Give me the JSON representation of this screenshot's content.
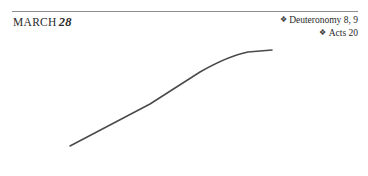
{
  "page": {
    "background_color": "#ffffff",
    "width": 368,
    "height": 176
  },
  "header": {
    "rule_color": "#8e8e8e",
    "date": {
      "month": "MARCH",
      "day": "28"
    }
  },
  "scriptures": {
    "marker_glyph": "❖",
    "items": [
      {
        "marker": "❖",
        "reference": "Deuteronomy 8, 9"
      },
      {
        "marker": "❖",
        "reference": "Acts 20"
      }
    ]
  },
  "illustration": {
    "type": "curved-line-drawing",
    "stroke_color": "#4a4a4a",
    "stroke_width": 1.5,
    "path": "M 70 146 L 150 104 L 200 72 Q 228 56 248 52 L 272 50"
  }
}
